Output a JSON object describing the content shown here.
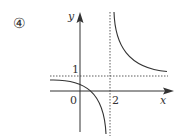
{
  "figure": {
    "option_label": "④",
    "axes": {
      "x_label": "x",
      "y_label": "y",
      "origin_label": "0"
    },
    "asymptotes": {
      "vertical_label": "2",
      "horizontal_label": "1"
    },
    "colors": {
      "ink": "#333333",
      "background": "#ffffff"
    }
  }
}
